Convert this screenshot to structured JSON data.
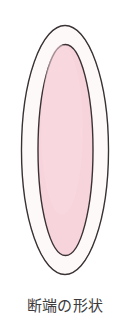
{
  "figure": {
    "caption": "断端の形状",
    "caption_romaji_hint": "dantan no keijou",
    "background_color": "#ffffff"
  },
  "diagram": {
    "type": "concentric-ellipse-cross-section",
    "outer_ellipse": {
      "name": "outer-boundary-ellipse",
      "cx": 65,
      "cy": 150,
      "rx": 43.5,
      "ry": 124.5,
      "fill_color": "#fdfcfb",
      "stroke_color": "#3a3133",
      "stroke_width": 1.4
    },
    "inner_ellipse": {
      "name": "inner-tissue-ellipse",
      "cx": 65.5,
      "cy": 150,
      "rx": 27.5,
      "ry": 105.5,
      "fill_color": "#f7d3dc",
      "stroke_color": "#3a3133",
      "stroke_width": 1.4
    },
    "ring": {
      "name": "outer-ring-band",
      "fill_color": "#fdfcfb"
    }
  },
  "colors": {
    "outline": "#3a3133",
    "inner_fill": "#f7d3dc",
    "ring_fill": "#fdfcfb",
    "caption_text": "#3c3a3b",
    "page_background": "#ffffff"
  }
}
